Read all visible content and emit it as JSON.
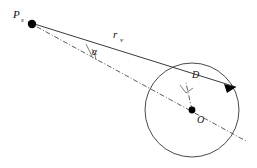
{
  "figure": {
    "title": "",
    "background_color": "#ffffff",
    "line_color": "#3a3a3a",
    "labels": {
      "source_point": "P",
      "source_point_subscript": "s",
      "distance": "r",
      "distance_subscript": "v",
      "angle": "α",
      "impact_parameter": "D",
      "center_point": "O"
    },
    "icons": {
      "arrowhead": "arrowhead-icon",
      "right_angle": "right-angle-marker-icon",
      "angle_arc": "angle-arc-icon",
      "source_dot": "filled-dot-icon",
      "center_dot": "filled-dot-icon"
    }
  },
  "geometry": {
    "source": {
      "x": 28,
      "y": 22
    },
    "center": {
      "x": 192,
      "y": 110
    },
    "circle_radius": 46,
    "ray_end": {
      "x": 240,
      "y": 89
    },
    "perp_foot": {
      "x": 186,
      "y": 84
    }
  }
}
